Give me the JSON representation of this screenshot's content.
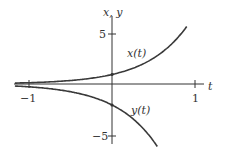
{
  "chart_data": {
    "type": "line",
    "title": "",
    "xlabel": "t",
    "ylabel": "x, y",
    "xlim": [
      -1.2,
      1.1
    ],
    "ylim": [
      -6,
      6
    ],
    "xticks": [
      -1,
      1
    ],
    "xtick_labels": [
      "-1",
      "1"
    ],
    "yticks": [
      5,
      -5
    ],
    "ytick_labels": [
      "5",
      "-5"
    ],
    "grid": false,
    "legend": "inline labels",
    "series": [
      {
        "name": "x(t)",
        "label": "x(t)",
        "formula": "e^(2t)",
        "initial_value": 1,
        "color": "#3a3a3a",
        "x": [
          -1.2,
          -1,
          -0.5,
          0,
          0.25,
          0.5,
          0.75,
          0.9
        ],
        "values": [
          0.09,
          0.14,
          0.37,
          1.0,
          1.65,
          2.72,
          4.48,
          6.05
        ]
      },
      {
        "name": "y(t)",
        "label": "y(t)",
        "formula": "-2e^(2t)",
        "initial_value": -2,
        "color": "#3a3a3a",
        "x": [
          -1.2,
          -1,
          -0.5,
          0,
          0.25,
          0.5,
          0.55
        ],
        "values": [
          -0.18,
          -0.27,
          -0.74,
          -2.0,
          -3.3,
          -5.44,
          -6.0
        ]
      }
    ]
  },
  "labels": {
    "axis_y": "x, y",
    "axis_x": "t",
    "tick_y_pos": "5",
    "tick_y_neg": "−5",
    "tick_x_neg": "−1",
    "tick_x_pos": "1",
    "series_x": "x(t)",
    "series_y": "y(t)"
  }
}
